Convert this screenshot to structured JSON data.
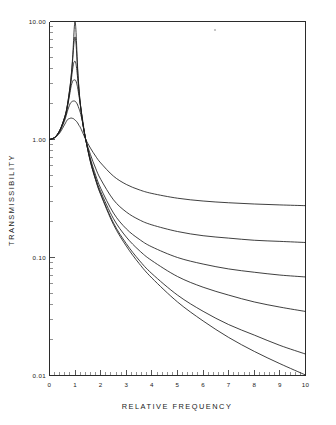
{
  "chart_data": {
    "type": "line",
    "title": "",
    "xlabel": "RELATIVE FREQUENCY",
    "ylabel": "TRANSMISSIBILITY",
    "xscale": "linear",
    "yscale": "log",
    "xlim": [
      0,
      10
    ],
    "ylim": [
      0.01,
      10.0
    ],
    "grid": false,
    "legend": "none",
    "x_ticks": [
      0,
      1,
      2,
      3,
      4,
      5,
      6,
      7,
      8,
      9,
      10
    ],
    "x_tick_labels": [
      "0",
      "1",
      "2",
      "3",
      "4",
      "5",
      "6",
      "7",
      "8",
      "9",
      "10"
    ],
    "x_minor_tick_count": 50,
    "y_ticks": [
      0.01,
      0.1,
      1.0,
      10.0
    ],
    "y_tick_labels": [
      "0.01",
      "0.10",
      "1.00",
      "10.00"
    ],
    "crossover_point": {
      "x": 1.414,
      "y": 1.0
    },
    "series": [
      {
        "name": "damping-0.03",
        "damping_ratio": 0.03,
        "peak_x": 1.0,
        "peak_y": 10.0,
        "x": [
          0.0,
          0.2,
          0.4,
          0.6,
          0.7,
          0.8,
          0.85,
          0.9,
          0.94,
          0.97,
          1.0,
          1.03,
          1.06,
          1.1,
          1.15,
          1.2,
          1.3,
          1.414,
          1.6,
          1.8,
          2.0,
          2.5,
          3.0,
          3.5,
          4.0,
          5.0,
          6.0,
          7.0,
          8.0,
          9.0,
          10.0
        ],
        "y": [
          1.0,
          1.042,
          1.193,
          1.566,
          1.967,
          2.793,
          3.53,
          4.83,
          6.9,
          9.0,
          10.0,
          8.6,
          6.3,
          4.0,
          2.72,
          2.06,
          1.37,
          1.0,
          0.645,
          0.455,
          0.341,
          0.19,
          0.125,
          0.089,
          0.067,
          0.042,
          0.029,
          0.021,
          0.016,
          0.0126,
          0.0101
        ]
      },
      {
        "name": "damping-0.05",
        "damping_ratio": 0.05,
        "peak_x": 1.0,
        "peak_y": 7.4,
        "x": [
          0.0,
          0.2,
          0.4,
          0.6,
          0.7,
          0.8,
          0.85,
          0.9,
          0.94,
          0.97,
          1.0,
          1.03,
          1.06,
          1.1,
          1.15,
          1.2,
          1.3,
          1.414,
          1.6,
          1.8,
          2.0,
          2.5,
          3.0,
          3.5,
          4.0,
          5.0,
          6.0,
          7.0,
          8.0,
          9.0,
          10.0
        ],
        "y": [
          1.0,
          1.042,
          1.192,
          1.563,
          1.959,
          2.762,
          3.46,
          4.6,
          6.0,
          7.0,
          7.4,
          6.7,
          5.4,
          3.8,
          2.67,
          2.04,
          1.37,
          1.0,
          0.648,
          0.459,
          0.346,
          0.196,
          0.131,
          0.095,
          0.073,
          0.048,
          0.035,
          0.027,
          0.022,
          0.018,
          0.0152
        ]
      },
      {
        "name": "damping-0.10",
        "damping_ratio": 0.1,
        "peak_x": 1.0,
        "peak_y": 4.6,
        "x": [
          0.0,
          0.2,
          0.4,
          0.6,
          0.7,
          0.8,
          0.85,
          0.9,
          0.94,
          0.97,
          1.0,
          1.03,
          1.06,
          1.1,
          1.15,
          1.2,
          1.3,
          1.414,
          1.6,
          1.8,
          2.0,
          2.5,
          3.0,
          3.5,
          4.0,
          5.0,
          6.0,
          7.0,
          8.0,
          9.0,
          10.0
        ],
        "y": [
          1.0,
          1.041,
          1.189,
          1.549,
          1.925,
          2.648,
          3.2,
          3.9,
          4.4,
          4.57,
          4.6,
          4.4,
          4.0,
          3.3,
          2.55,
          2.0,
          1.38,
          1.0,
          0.66,
          0.473,
          0.361,
          0.213,
          0.149,
          0.115,
          0.094,
          0.069,
          0.056,
          0.048,
          0.042,
          0.038,
          0.0349
        ]
      },
      {
        "name": "damping-0.15",
        "damping_ratio": 0.15,
        "peak_x": 1.0,
        "peak_y": 3.2,
        "x": [
          0.0,
          0.2,
          0.4,
          0.6,
          0.7,
          0.8,
          0.85,
          0.9,
          0.94,
          0.97,
          1.0,
          1.03,
          1.06,
          1.1,
          1.15,
          1.2,
          1.3,
          1.414,
          1.6,
          1.8,
          2.0,
          2.5,
          3.0,
          3.5,
          4.0,
          5.0,
          6.0,
          7.0,
          8.0,
          9.0,
          10.0
        ],
        "y": [
          1.0,
          1.04,
          1.184,
          1.527,
          1.873,
          2.49,
          2.86,
          3.1,
          3.19,
          3.2,
          3.2,
          3.14,
          3.0,
          2.74,
          2.35,
          2.0,
          1.44,
          1.0,
          0.687,
          0.5,
          0.386,
          0.238,
          0.175,
          0.143,
          0.123,
          0.1,
          0.088,
          0.08,
          0.075,
          0.071,
          0.0684
        ]
      },
      {
        "name": "damping-0.25",
        "damping_ratio": 0.25,
        "peak_x": 0.96,
        "peak_y": 2.12,
        "x": [
          0.0,
          0.2,
          0.4,
          0.6,
          0.7,
          0.8,
          0.85,
          0.9,
          0.94,
          0.97,
          1.0,
          1.03,
          1.06,
          1.1,
          1.15,
          1.2,
          1.3,
          1.414,
          1.6,
          1.8,
          2.0,
          2.5,
          3.0,
          3.5,
          4.0,
          5.0,
          6.0,
          7.0,
          8.0,
          9.0,
          10.0
        ],
        "y": [
          1.0,
          1.037,
          1.169,
          1.465,
          1.74,
          2.0,
          2.07,
          2.11,
          2.12,
          2.12,
          2.11,
          2.08,
          2.04,
          1.96,
          1.83,
          1.7,
          1.37,
          1.0,
          0.745,
          0.572,
          0.46,
          0.308,
          0.243,
          0.209,
          0.189,
          0.166,
          0.153,
          0.146,
          0.14,
          0.137,
          0.134
        ]
      },
      {
        "name": "damping-0.40",
        "damping_ratio": 0.4,
        "peak_x": 0.85,
        "peak_y": 1.52,
        "x": [
          0.0,
          0.2,
          0.4,
          0.6,
          0.7,
          0.8,
          0.85,
          0.9,
          0.94,
          0.97,
          1.0,
          1.03,
          1.06,
          1.1,
          1.15,
          1.2,
          1.3,
          1.414,
          1.6,
          1.8,
          2.0,
          2.5,
          3.0,
          3.5,
          4.0,
          5.0,
          6.0,
          7.0,
          8.0,
          9.0,
          10.0
        ],
        "y": [
          1.0,
          1.031,
          1.137,
          1.35,
          1.47,
          1.51,
          1.52,
          1.51,
          1.5,
          1.48,
          1.46,
          1.44,
          1.42,
          1.38,
          1.32,
          1.27,
          1.14,
          1.0,
          0.845,
          0.723,
          0.633,
          0.489,
          0.416,
          0.375,
          0.349,
          0.318,
          0.301,
          0.291,
          0.284,
          0.279,
          0.275
        ]
      }
    ]
  },
  "axis_titles": {
    "x": "RELATIVE FREQUENCY",
    "y": "TRANSMISSIBILITY"
  }
}
